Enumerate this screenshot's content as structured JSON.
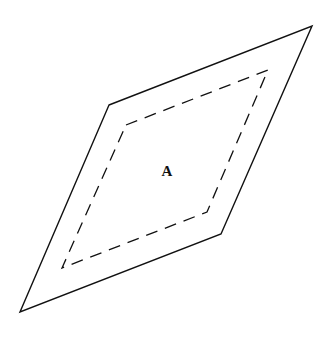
{
  "diagram": {
    "outer_shape": {
      "type": "parallelogram",
      "style": "solid",
      "stroke_color": "#111111",
      "points": [
        [
          109,
          105
        ],
        [
          312,
          26
        ],
        [
          221,
          234
        ],
        [
          20,
          312
        ]
      ]
    },
    "inner_shape": {
      "type": "parallelogram",
      "style": "dashed",
      "stroke_color": "#111111",
      "points": [
        [
          126,
          125
        ],
        [
          268,
          70
        ],
        [
          207,
          212
        ],
        [
          62,
          268
        ]
      ]
    },
    "label": {
      "text": "A",
      "x": 167,
      "y": 176
    }
  }
}
